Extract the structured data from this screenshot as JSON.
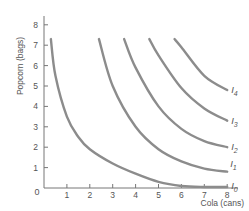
{
  "chart_data": {
    "type": "line",
    "title": "",
    "xlabel": "Cola (cans)",
    "ylabel": "Popcorn (bags)",
    "xlim": [
      0,
      8.5
    ],
    "ylim": [
      0,
      8.3
    ],
    "x_ticks": [
      "0",
      "1",
      "2",
      "3",
      "4",
      "5",
      "6",
      "7",
      "8"
    ],
    "y_ticks": [
      "1",
      "2",
      "3",
      "4",
      "5",
      "6",
      "7",
      "8"
    ],
    "origin_label": "0",
    "grid": false,
    "legend": "inline labels at right end of curves",
    "series": [
      {
        "name": "I0",
        "label_main": "I",
        "label_sub": "0",
        "x": [
          0.3,
          0.5,
          1,
          1.5,
          2,
          3,
          4,
          5,
          6,
          7,
          8
        ],
        "y": [
          7.3,
          5.5,
          3.5,
          2.5,
          1.9,
          1.2,
          0.7,
          0.3,
          0.1,
          0.05,
          0.05
        ]
      },
      {
        "name": "I1",
        "label_main": "I",
        "label_sub": "1",
        "x": [
          2.4,
          3,
          4,
          5,
          6,
          7,
          8
        ],
        "y": [
          7.3,
          5.0,
          3.0,
          1.9,
          1.3,
          0.95,
          0.8
        ]
      },
      {
        "name": "I2",
        "label_main": "I",
        "label_sub": "2",
        "x": [
          3.5,
          4,
          5,
          6,
          7,
          8
        ],
        "y": [
          7.3,
          5.9,
          4.0,
          2.9,
          2.3,
          2.0
        ]
      },
      {
        "name": "I3",
        "label_main": "I",
        "label_sub": "3",
        "x": [
          4.6,
          5,
          6,
          7,
          8
        ],
        "y": [
          7.3,
          6.5,
          4.9,
          3.9,
          3.3
        ]
      },
      {
        "name": "I4",
        "label_main": "I",
        "label_sub": "4",
        "x": [
          5.7,
          6,
          7,
          8
        ],
        "y": [
          7.3,
          6.9,
          5.5,
          4.8
        ]
      }
    ],
    "curve_color": "#8c8c8c",
    "axis_color": "#777777"
  }
}
